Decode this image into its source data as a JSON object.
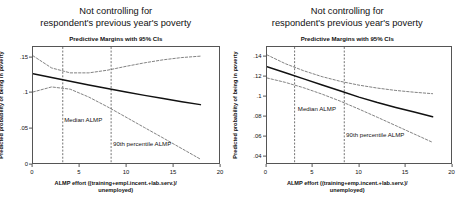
{
  "figure": {
    "panels": [
      {
        "id": "left",
        "title_line1": "Not controlling for",
        "title_line2": "respondent's previous year's poverty",
        "subtitle": "Predictive Margins with 95% CIs",
        "xlabel_line1": "ALMP effort ((training+empl.incent.+lab.serv.)/",
        "xlabel_line2": "unemployed)",
        "ylabel": "Predicted probability of being in poverty",
        "annotations": [
          {
            "text": "Median ALMP",
            "x": 3.35,
            "y": 0.0585
          },
          {
            "text": "90th percentile ALMP",
            "x": 8.6,
            "y": 0.0245
          }
        ],
        "chart_data": {
          "type": "line",
          "title": "Not controlling for respondent's previous year's poverty",
          "subtitle": "Predictive Margins with 95% CIs",
          "xlabel": "ALMP effort ((training+empl.incent.+lab.serv.)/unemployed)",
          "ylabel": "Predicted probability of being in poverty",
          "xlim": [
            0,
            20
          ],
          "ylim": [
            0,
            0.165
          ],
          "xticks": [
            0,
            5,
            10,
            15,
            20
          ],
          "xticklabels": [
            "0",
            "5",
            "10",
            "15",
            "20"
          ],
          "yticks": [
            0,
            0.05,
            0.1,
            0.15
          ],
          "yticklabels": [
            "0",
            ".05",
            ".1",
            ".15"
          ],
          "grid": false,
          "legend": "none",
          "vlines": [
            {
              "x": 3.2,
              "label": "Median ALMP",
              "style": "dashed"
            },
            {
              "x": 8.4,
              "label": "90th percentile ALMP",
              "style": "dashed"
            }
          ],
          "x": [
            0,
            2,
            4,
            6,
            8,
            10,
            12,
            14,
            16,
            18
          ],
          "series": [
            {
              "name": "Predicted probability",
              "style": "solid",
              "values": [
                0.127,
                0.1215,
                0.1162,
                0.111,
                0.1059,
                0.101,
                0.0962,
                0.0916,
                0.0872,
                0.083
              ]
            },
            {
              "name": "95% CI upper",
              "style": "dashed",
              "values": [
                0.1525,
                0.1352,
                0.1282,
                0.1282,
                0.132,
                0.1375,
                0.1425,
                0.1468,
                0.15,
                0.152
              ]
            },
            {
              "name": "95% CI lower",
              "style": "dashed",
              "values": [
                0.101,
                0.1082,
                0.105,
                0.0938,
                0.08,
                0.0652,
                0.0503,
                0.0355,
                0.0205,
                0.0055
              ]
            }
          ]
        }
      },
      {
        "id": "right",
        "title_line1": "Not controlling for",
        "title_line2": "respondent's previous year's poverty",
        "subtitle": "Predictive Margins with 95% CIs",
        "xlabel_line1": "ALMP effort ((training+emp.incent.+lab.serv.)/",
        "xlabel_line2": "unemployed)",
        "ylabel": "Predicted probability of being in poverty",
        "annotations": [
          {
            "text": "Median ALMP",
            "x": 3.35,
            "y": 0.0845
          },
          {
            "text": "90th percentile ALMP",
            "x": 8.6,
            "y": 0.0585
          }
        ],
        "chart_data": {
          "type": "line",
          "title": "Not controlling for respondent's previous year's poverty",
          "subtitle": "Predictive Margins with 95% CIs",
          "xlabel": "ALMP effort ((training+emp.incent.+lab.serv.)/unemployed)",
          "ylabel": "Predicted probability of being in poverty",
          "xlim": [
            0,
            20
          ],
          "ylim": [
            0.032,
            0.15
          ],
          "xticks": [
            0,
            5,
            10,
            15,
            20
          ],
          "xticklabels": [
            "0",
            "5",
            "10",
            "15",
            "20"
          ],
          "yticks": [
            0.04,
            0.06,
            0.08,
            0.1,
            0.12,
            0.14
          ],
          "yticklabels": [
            ".04",
            ".06",
            ".08",
            ".1",
            ".12",
            ".14"
          ],
          "grid": false,
          "legend": "none",
          "vlines": [
            {
              "x": 3.0,
              "label": "Median ALMP",
              "style": "dashed"
            },
            {
              "x": 8.4,
              "label": "90th percentile ALMP",
              "style": "dashed"
            }
          ],
          "x": [
            0,
            2,
            4,
            6,
            8,
            10,
            12,
            14,
            16,
            18
          ],
          "series": [
            {
              "name": "Predicted probability",
              "style": "solid",
              "values": [
                0.13,
                0.1238,
                0.1176,
                0.1114,
                0.1052,
                0.099,
                0.0935,
                0.0885,
                0.0838,
                0.079
              ]
            },
            {
              "name": "95% CI upper",
              "style": "dashed",
              "values": [
                0.142,
                0.133,
                0.1258,
                0.1198,
                0.115,
                0.1112,
                0.1082,
                0.1058,
                0.104,
                0.1025
              ]
            },
            {
              "name": "95% CI lower",
              "style": "dashed",
              "values": [
                0.1185,
                0.114,
                0.1085,
                0.102,
                0.0948,
                0.0868,
                0.0785,
                0.07,
                0.0615,
                0.053
              ]
            }
          ]
        }
      }
    ]
  }
}
